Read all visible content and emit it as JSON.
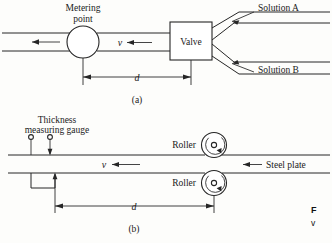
{
  "figure": {
    "panels": [
      {
        "tag": "(a)",
        "name": "flow-mixing-valve-diagram",
        "labels": {
          "metering_point_line1": "Metering",
          "metering_point_line2": "point",
          "valve": "Valve",
          "solution_a": "Solution A",
          "solution_b": "Solution B",
          "velocity": "v",
          "distance": "d"
        }
      },
      {
        "tag": "(b)",
        "name": "steel-plate-rolling-diagram",
        "labels": {
          "gauge_line1": "Thickness",
          "gauge_line2": "measuring gauge",
          "roller_top": "Roller",
          "roller_bottom": "Roller",
          "steel_plate": "Steel plate",
          "velocity": "v",
          "distance": "d"
        }
      }
    ],
    "caption": {
      "prefix": "F",
      "second_line": "v"
    },
    "colors": {
      "ink": "#262626",
      "paper": "#fdfdfb"
    }
  }
}
